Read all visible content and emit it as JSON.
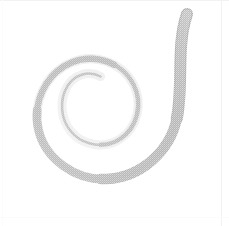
{
  "canvas": {
    "width": 229,
    "height": 226,
    "background_color": "#ffffff",
    "title": "Spiral"
  },
  "figure": {
    "name": "spiral",
    "turns": 2.15,
    "winding": "clockwise-outward",
    "center_x": 88,
    "center_y": 108,
    "inner_tip_x": 100,
    "inner_tip_y": 76,
    "outer_tip_x": 187,
    "outer_tip_y": 14,
    "stroke_color": "#cfcfcf",
    "stroke_color_light": "#e2e2e2",
    "stroke_color_dark": "#bdbdbd",
    "stroke_width_min": 1.5,
    "stroke_width_max": 14,
    "texture": "halftone-dither",
    "opacity": 0.95
  },
  "geometry": {
    "path": "M 100.5 76.5 C 88 70 74 75 67.5 86 C 59 100 60.5 119 71 131.5 C 83 146 105 149 120 139 C 138 127 143 103 133.5 84.5 C 122 62 94 53 71.5 62.5 C 45.5 73.5 32 103 38.5 130 C 45.5 159.5 76 180.5 106.5 179 C 141 177.5 170.5 151 177 117.5 C 183.5 84 176 46 187 14",
    "note": "approximate outline of spiral centerline in canvas coordinates"
  },
  "edges": {
    "top_line_color": "#f2f2f2",
    "right_line_color": "#f2f2f2",
    "right_line_x": 222,
    "bottom_line_color": "#fbfbfb",
    "left_line_color": "#fcfcfc"
  }
}
